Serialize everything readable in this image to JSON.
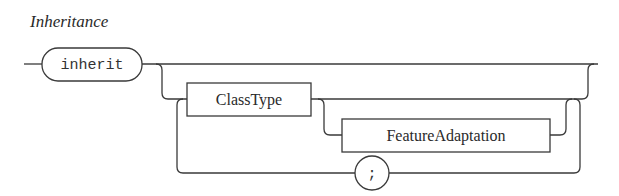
{
  "title": "Inheritance",
  "terminals": {
    "inherit": "inherit",
    "semicolon": ";"
  },
  "nonterminals": {
    "class_type": "ClassType",
    "feature_adaptation": "FeatureAdaptation"
  },
  "colors": {
    "stroke": "#3a3a3a",
    "text": "#2a2a2a",
    "background": "#ffffff"
  }
}
